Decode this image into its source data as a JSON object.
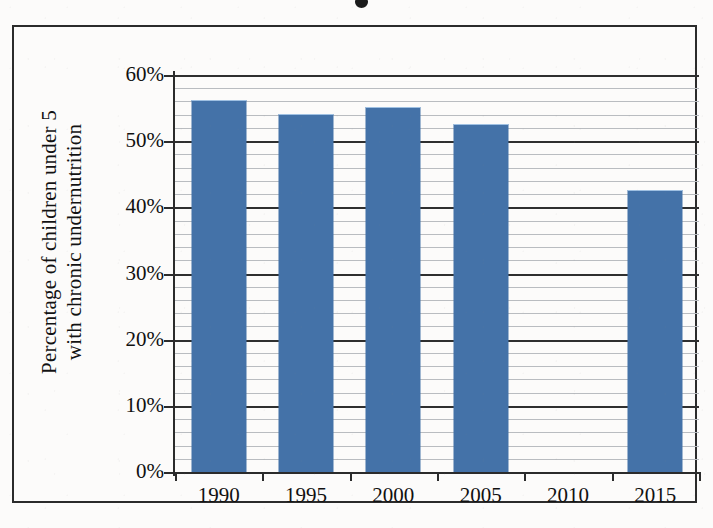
{
  "figure": {
    "title_visible_remnant": "•",
    "frame_color": "#2b2b2b",
    "background_color": "#fcfbfa"
  },
  "chart_data": {
    "type": "bar",
    "title": "",
    "xlabel": "",
    "ylabel": "Percentage of children under 5 with chronic undernutrition",
    "ylabel_lines": [
      "Percentage of children under 5",
      "with chronic undernutrition"
    ],
    "categories": [
      "1990",
      "1995",
      "2000",
      "2005",
      "2010",
      "2015"
    ],
    "values": [
      56,
      54,
      55,
      52.5,
      null,
      42.5
    ],
    "value_labels": [
      "56%",
      "54%",
      "55%",
      "52.5%",
      "",
      "42.5%"
    ],
    "ylim": [
      0,
      60
    ],
    "ytick_values": [
      0,
      10,
      20,
      30,
      40,
      50,
      60
    ],
    "ytick_labels": [
      "0%",
      "10%",
      "20%",
      "30%",
      "40%",
      "50%",
      "60%"
    ],
    "minor_tick_step": 2,
    "grid": true,
    "grid_major_color": "#2f2f2f",
    "grid_minor_color": "#b9bcc0",
    "legend": null,
    "legend_position": "none",
    "bar_color": "#4472a8",
    "bar_highlight_color": "#9fc0e2",
    "series": [
      {
        "name": "Percentage of children under 5 with chronic undernutrition",
        "values": [
          56,
          54,
          55,
          52.5,
          null,
          42.5
        ]
      }
    ]
  }
}
